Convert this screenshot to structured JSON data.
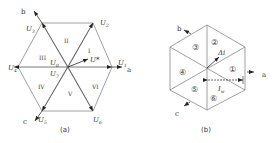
{
  "diagram_a": {
    "caption": "(a)",
    "axes": {
      "a": "a",
      "b": "b",
      "c": "c"
    },
    "vectors": [
      {
        "name": "U",
        "sub": "1"
      },
      {
        "name": "U",
        "sub": "2"
      },
      {
        "name": "U",
        "sub": "3"
      },
      {
        "name": "U",
        "sub": "4"
      },
      {
        "name": "U",
        "sub": "5"
      },
      {
        "name": "U",
        "sub": "6"
      },
      {
        "name": "U",
        "sub": "0"
      },
      {
        "name": "U",
        "sub": "7"
      }
    ],
    "reference_vector": "U*",
    "sectors": [
      "I",
      "II",
      "III",
      "IV",
      "V",
      "VI"
    ]
  },
  "diagram_b": {
    "caption": "(b)",
    "axes": {
      "a": "a",
      "b": "b",
      "c": "c"
    },
    "sectors": [
      "①",
      "②",
      "③",
      "④",
      "⑤",
      "⑥"
    ],
    "delta_label": "Δi",
    "width_label": "I",
    "width_sub": "w"
  }
}
